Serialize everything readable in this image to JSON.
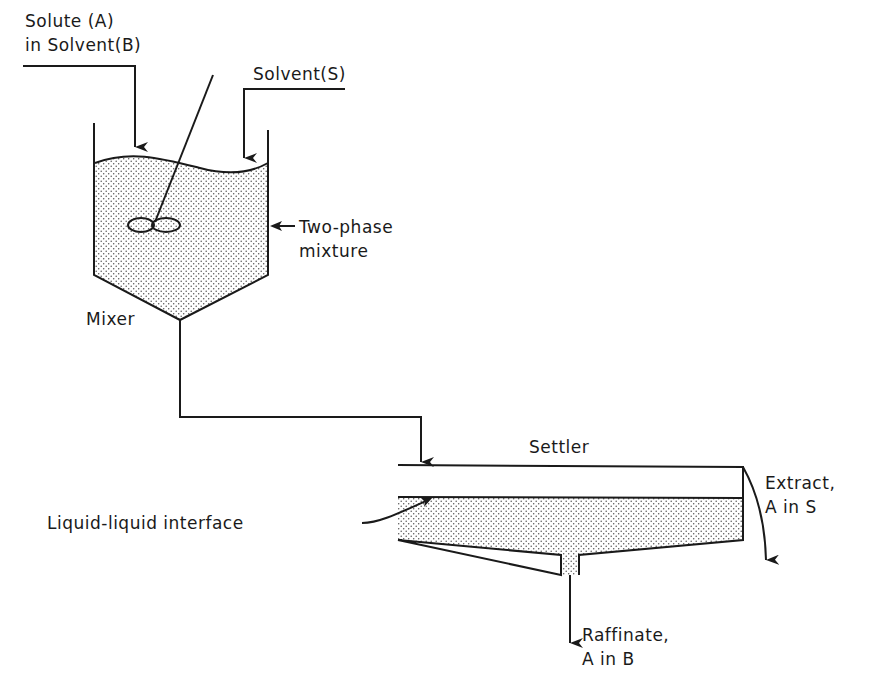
{
  "diagram": {
    "type": "process-flow",
    "units": [
      {
        "id": "mixer",
        "label": "Mixer"
      },
      {
        "id": "settler",
        "label": "Settler"
      }
    ],
    "labels": {
      "feed_line1": "Solute (A)",
      "feed_line2": "in Solvent(B)",
      "solvent": "Solvent(S)",
      "mixture_line1": "Two-phase",
      "mixture_line2": "mixture",
      "mixer": "Mixer",
      "settler": "Settler",
      "interface": "Liquid-liquid interface",
      "extract_line1": "Extract,",
      "extract_line2": "A in S",
      "raffinate_line1": "Raffinate,",
      "raffinate_line2": "A in B"
    },
    "streams": [
      {
        "from": "feed",
        "to": "mixer",
        "label": "Solute (A) in Solvent(B)"
      },
      {
        "from": "solvent",
        "to": "mixer",
        "label": "Solvent(S)"
      },
      {
        "from": "mixer",
        "to": "settler",
        "label": ""
      },
      {
        "from": "settler",
        "to": "extract",
        "label": "Extract, A in S"
      },
      {
        "from": "settler",
        "to": "raffinate",
        "label": "Raffinate, A in B"
      }
    ],
    "colors": {
      "ink": "#1a1a1a",
      "background": "#ffffff",
      "stipple": "#555555"
    }
  }
}
